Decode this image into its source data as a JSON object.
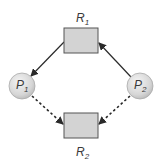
{
  "diagram": {
    "colors": {
      "background": "#ffffff",
      "resource_fill": "#d3d3d3",
      "resource_stroke": "#555555",
      "process_fill_light": "#f2f2f2",
      "process_fill_dark": "#bdbdbd",
      "process_stroke": "#aaaaaa",
      "edge": "#2a2a2a",
      "label": "#3a3a3a"
    },
    "resources": [
      {
        "id": "R1",
        "main": "R",
        "sub": "1",
        "x": 64,
        "y": 28,
        "w": 34,
        "h": 25,
        "label_x": 76,
        "label_y": 22
      },
      {
        "id": "R2",
        "main": "R",
        "sub": "2",
        "x": 64,
        "y": 113,
        "w": 34,
        "h": 25,
        "label_x": 76,
        "label_y": 156
      }
    ],
    "processes": [
      {
        "id": "P1",
        "main": "P",
        "sub": "1",
        "cx": 22,
        "cy": 86,
        "r": 13
      },
      {
        "id": "P2",
        "main": "P",
        "sub": "2",
        "cx": 140,
        "cy": 86,
        "r": 13
      }
    ],
    "edges": [
      {
        "from": "R1",
        "to": "P1",
        "type": "assignment",
        "style": "solid",
        "x1": 64,
        "y1": 42,
        "x2": 31,
        "y2": 76
      },
      {
        "from": "P2",
        "to": "R1",
        "type": "request",
        "style": "solid",
        "x1": 131,
        "y1": 77,
        "x2": 99,
        "y2": 43
      },
      {
        "from": "P1",
        "to": "R2",
        "type": "claim",
        "style": "dashed",
        "x1": 32,
        "y1": 96,
        "x2": 63,
        "y2": 124
      },
      {
        "from": "P2",
        "to": "R2",
        "type": "claim",
        "style": "dashed",
        "x1": 130,
        "y1": 96,
        "x2": 99,
        "y2": 124
      }
    ]
  }
}
